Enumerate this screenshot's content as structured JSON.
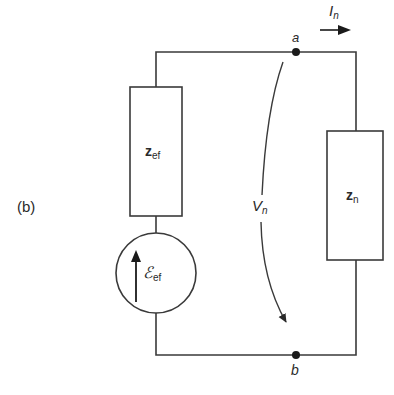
{
  "figure": {
    "panel_label": "(b)",
    "nodes": [
      {
        "id": "a",
        "label": "a"
      },
      {
        "id": "b",
        "label": "b"
      }
    ],
    "components": {
      "source_impedance": {
        "symbol": "z",
        "subscript": "ef"
      },
      "source_emf": {
        "symbol": "ℰ",
        "subscript": "ef"
      },
      "load_impedance": {
        "symbol": "z",
        "subscript": "n"
      }
    },
    "current": {
      "symbol": "I",
      "subscript": "n"
    },
    "voltage": {
      "symbol": "V",
      "subscript": "n"
    },
    "colors": {
      "line": "#3a3a3a",
      "background": "#ffffff"
    }
  }
}
